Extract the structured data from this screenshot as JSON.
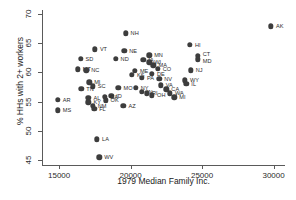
{
  "chart_data": {
    "type": "scatter",
    "title": "",
    "xlabel": "1979 Median Family Inc.",
    "ylabel": "% HHs with 2+ workers",
    "xlim": [
      13800,
      30800
    ],
    "ylim": [
      44.2,
      70.6
    ],
    "xticks": [
      15000,
      20000,
      25000,
      30000
    ],
    "yticks": [
      45,
      50,
      55,
      60,
      65,
      70
    ],
    "xtick_labels": [
      "15000",
      "20000",
      "25000",
      "30000"
    ],
    "ytick_labels": [
      "45",
      "50",
      "55",
      "60",
      "65",
      "70"
    ],
    "grid": false,
    "legend": false,
    "point_labels": true,
    "marker_color": "#3d3d3d",
    "axis_color": "#5a5a5a",
    "points": [
      {
        "label": "AK",
        "x": 29820,
        "y": 67.8,
        "lx": 5,
        "ly": 0
      },
      {
        "label": "NH",
        "x": 19650,
        "y": 66.6,
        "lx": 5,
        "ly": 0
      },
      {
        "label": "HI",
        "x": 24150,
        "y": 64.7,
        "lx": 5,
        "ly": 0
      },
      {
        "label": "VT",
        "x": 17500,
        "y": 63.9,
        "lx": 5,
        "ly": 0
      },
      {
        "label": "NE",
        "x": 19560,
        "y": 63.6,
        "lx": 5,
        "ly": 0
      },
      {
        "label": "CT",
        "x": 24700,
        "y": 62.8,
        "lx": 5,
        "ly": -2
      },
      {
        "label": "MD",
        "x": 24700,
        "y": 62.2,
        "lx": 5,
        "ly": 2
      },
      {
        "label": "MN",
        "x": 21300,
        "y": 62.9,
        "lx": 5,
        "ly": 0
      },
      {
        "label": "SD",
        "x": 16500,
        "y": 62.3,
        "lx": 5,
        "ly": 0
      },
      {
        "label": "ND",
        "x": 18950,
        "y": 62.3,
        "lx": 5,
        "ly": 0
      },
      {
        "label": "IA",
        "x": 20900,
        "y": 62.1,
        "lx": 5,
        "ly": 0
      },
      {
        "label": "WI",
        "x": 21300,
        "y": 61.7,
        "lx": 5,
        "ly": 0
      },
      {
        "label": "MA",
        "x": 21600,
        "y": 61.2,
        "lx": 5,
        "ly": 0
      },
      {
        "label": "CO",
        "x": 21900,
        "y": 60.6,
        "lx": 5,
        "ly": 0
      },
      {
        "label": "NJ",
        "x": 24200,
        "y": 60.3,
        "lx": 5,
        "ly": 0
      },
      {
        "label": "MT",
        "x": 16300,
        "y": 60.5,
        "lx": 5,
        "ly": 0
      },
      {
        "label": "NC",
        "x": 16900,
        "y": 60.3,
        "lx": 5,
        "ly": 0
      },
      {
        "label": "ME",
        "x": 20300,
        "y": 60.2,
        "lx": 5,
        "ly": 0
      },
      {
        "label": "KS",
        "x": 20100,
        "y": 59.6,
        "lx": 5,
        "ly": 0
      },
      {
        "label": "DE",
        "x": 21500,
        "y": 59.7,
        "lx": 5,
        "ly": 0
      },
      {
        "label": "PA",
        "x": 20800,
        "y": 59.0,
        "lx": 5,
        "ly": 0
      },
      {
        "label": "NV",
        "x": 22000,
        "y": 58.9,
        "lx": 5,
        "ly": 0
      },
      {
        "label": "WY",
        "x": 23800,
        "y": 58.6,
        "lx": 5,
        "ly": 0
      },
      {
        "label": "IL",
        "x": 23900,
        "y": 58.0,
        "lx": 5,
        "ly": 0
      },
      {
        "label": "MI",
        "x": 17100,
        "y": 58.3,
        "lx": 5,
        "ly": 0
      },
      {
        "label": "SC",
        "x": 17350,
        "y": 57.6,
        "lx": 5,
        "ly": 0
      },
      {
        "label": "TN",
        "x": 16550,
        "y": 57.2,
        "lx": 5,
        "ly": 0
      },
      {
        "label": "MO",
        "x": 19150,
        "y": 57.3,
        "lx": 5,
        "ly": 0
      },
      {
        "label": "NY",
        "x": 20350,
        "y": 57.3,
        "lx": 5,
        "ly": 0
      },
      {
        "label": "VA",
        "x": 22100,
        "y": 57.8,
        "lx": 5,
        "ly": 0
      },
      {
        "label": "CA",
        "x": 22500,
        "y": 57.1,
        "lx": 5,
        "ly": 0
      },
      {
        "label": "IN",
        "x": 20800,
        "y": 56.7,
        "lx": 5,
        "ly": 0
      },
      {
        "label": "RI",
        "x": 21150,
        "y": 56.4,
        "lx": 5,
        "ly": 0
      },
      {
        "label": "OH",
        "x": 21500,
        "y": 56.1,
        "lx": 5,
        "ly": 0
      },
      {
        "label": "WA",
        "x": 22750,
        "y": 56.4,
        "lx": 5,
        "ly": 0
      },
      {
        "label": "ID",
        "x": 18650,
        "y": 56.0,
        "lx": 5,
        "ly": 0
      },
      {
        "label": "GA",
        "x": 18200,
        "y": 55.8,
        "lx": 5,
        "ly": 0
      },
      {
        "label": "MI",
        "x": 23050,
        "y": 55.7,
        "lx": 5,
        "ly": 0
      },
      {
        "label": "AL",
        "x": 17050,
        "y": 55.6,
        "lx": 5,
        "ly": 0
      },
      {
        "label": "AR",
        "x": 14900,
        "y": 55.3,
        "lx": 5,
        "ly": 0
      },
      {
        "label": "OK",
        "x": 18250,
        "y": 55.2,
        "lx": 5,
        "ly": 0
      },
      {
        "label": "KY",
        "x": 17050,
        "y": 54.9,
        "lx": 5,
        "ly": 0
      },
      {
        "label": "NM",
        "x": 17350,
        "y": 54.3,
        "lx": 5,
        "ly": 0
      },
      {
        "label": "AZ",
        "x": 19500,
        "y": 54.3,
        "lx": 5,
        "ly": 0
      },
      {
        "label": "FL",
        "x": 17450,
        "y": 53.8,
        "lx": 5,
        "ly": 0
      },
      {
        "label": "MS",
        "x": 14900,
        "y": 53.5,
        "lx": 5,
        "ly": 0
      },
      {
        "label": "LA",
        "x": 17650,
        "y": 48.6,
        "lx": 5,
        "ly": 0
      },
      {
        "label": "WV",
        "x": 17800,
        "y": 45.5,
        "lx": 5,
        "ly": 0
      }
    ]
  }
}
